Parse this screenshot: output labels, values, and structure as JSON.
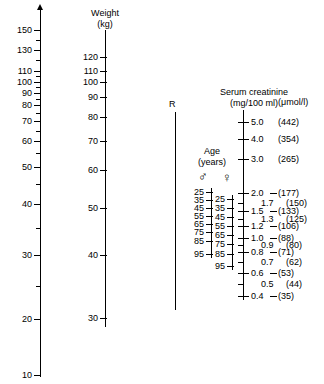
{
  "figure": {
    "type": "nomogram"
  },
  "left_scale": {
    "name": "left-axis",
    "arrow": true,
    "labels": [
      "150",
      "130",
      "110",
      "100",
      "90",
      "80",
      "70",
      "60",
      "50",
      "40",
      "30",
      "20",
      "10"
    ],
    "tick_y": [
      30,
      50,
      71,
      82,
      93,
      105,
      121,
      141,
      167,
      204,
      255,
      319,
      375
    ],
    "minor_tick_y": [
      40,
      60,
      76,
      87,
      99,
      113,
      131,
      153,
      184,
      228,
      286
    ],
    "axis_top_y": 10,
    "axis_bottom_y": 377,
    "axis_x": 40
  },
  "weight_scale": {
    "title_line1": "Weight",
    "title_line2": "(kg)",
    "labels": [
      "120",
      "110",
      "100",
      "90",
      "80",
      "70",
      "60",
      "50",
      "40",
      "30"
    ],
    "tick_y": [
      57,
      71,
      82,
      97,
      117,
      141,
      170,
      208,
      255,
      318
    ],
    "axis_top_y": 30,
    "axis_bottom_y": 327,
    "axis_x": 105
  },
  "reference_line": {
    "label": "R",
    "axis_x": 175,
    "axis_top_y": 112,
    "axis_bottom_y": 310,
    "label_y": 104
  },
  "age_scale": {
    "title_line1": "Age",
    "title_line2": "(years)",
    "male_symbol": "♂",
    "female_symbol": "♀",
    "male": {
      "labels": [
        "25",
        "35",
        "45",
        "55",
        "65",
        "75",
        "85",
        "95"
      ],
      "tick_y": [
        192,
        200,
        208,
        216,
        224,
        232,
        241,
        254
      ]
    },
    "female": {
      "labels": [
        "25",
        "35",
        "45",
        "55",
        "65",
        "75",
        "85",
        "95"
      ],
      "tick_y": [
        199,
        208,
        217,
        226,
        235,
        244,
        254,
        266
      ]
    },
    "male_axis_x": 211,
    "male_axis_top_y": 188,
    "male_axis_bottom_y": 258,
    "female_axis_x": 232,
    "female_axis_top_y": 195,
    "female_axis_bottom_y": 270
  },
  "creatinine_scale": {
    "title_line1": "Serum creatinine",
    "title_line2": "(mg/100 ml)",
    "unit_si": "(μmol/l)",
    "axis_x": 243,
    "axis_top_y": 110,
    "axis_bottom_y": 300,
    "entries": [
      {
        "mg": "5.0",
        "si": "(442)",
        "y": 122
      },
      {
        "mg": "4.0",
        "si": "(354)",
        "y": 139
      },
      {
        "mg": "3.0",
        "si": "(265)",
        "y": 159
      },
      {
        "mg": "2.0",
        "si": "(177)",
        "y": 193
      },
      {
        "mg": "1.7",
        "si": "(150)",
        "y": 203
      },
      {
        "mg": "1.5",
        "si": "(133)",
        "y": 211
      },
      {
        "mg": "1.3",
        "si": "(125)",
        "y": 219
      },
      {
        "mg": "1.2",
        "si": "(106)",
        "y": 226
      },
      {
        "mg": "1.0",
        "si": "(88)",
        "y": 238
      },
      {
        "mg": "0.9",
        "si": "(80)",
        "y": 245
      },
      {
        "mg": "0.8",
        "si": "(71)",
        "y": 252
      },
      {
        "mg": "0.7",
        "si": "(62)",
        "y": 262
      },
      {
        "mg": "0.6",
        "si": "(53)",
        "y": 273
      },
      {
        "mg": "0.5",
        "si": "(44)",
        "y": 284
      },
      {
        "mg": "0.4",
        "si": "(35)",
        "y": 296
      }
    ]
  },
  "chart_data": {
    "type": "nomogram",
    "axes": [
      {
        "name": "left-index-axis",
        "scale": "log",
        "ticks": [
          150,
          130,
          110,
          100,
          90,
          80,
          70,
          60,
          50,
          40,
          30,
          20,
          10
        ],
        "range": [
          10,
          160
        ]
      },
      {
        "name": "weight",
        "unit": "kg",
        "scale": "log",
        "ticks": [
          120,
          110,
          100,
          90,
          80,
          70,
          60,
          50,
          40,
          30
        ],
        "range": [
          30,
          120
        ]
      },
      {
        "name": "age-male",
        "unit": "years",
        "ticks": [
          25,
          35,
          45,
          55,
          65,
          75,
          85,
          95
        ],
        "range": [
          25,
          95
        ]
      },
      {
        "name": "age-female",
        "unit": "years",
        "ticks": [
          25,
          35,
          45,
          55,
          65,
          75,
          85,
          95
        ],
        "range": [
          25,
          95
        ]
      },
      {
        "name": "serum-creatinine",
        "unit": "mg/100 ml",
        "scale": "log",
        "ticks": [
          5.0,
          4.0,
          3.0,
          2.0,
          1.7,
          1.5,
          1.3,
          1.2,
          1.0,
          0.9,
          0.8,
          0.7,
          0.6,
          0.5,
          0.4
        ],
        "range": [
          0.4,
          5.0
        ]
      },
      {
        "name": "serum-creatinine-si",
        "unit": "μmol/l",
        "ticks": [
          442,
          354,
          265,
          177,
          150,
          133,
          125,
          106,
          88,
          80,
          71,
          62,
          53,
          44,
          35
        ],
        "range": [
          35,
          442
        ]
      },
      {
        "name": "reference-line-R",
        "ticks": []
      }
    ]
  }
}
